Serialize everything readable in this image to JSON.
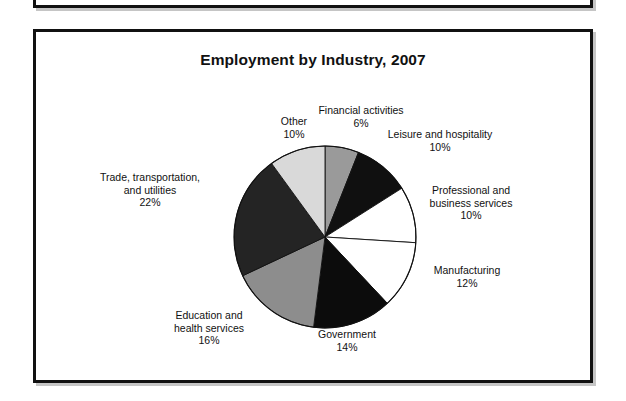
{
  "figure": {
    "title": "Employment by Industry, 2007"
  },
  "chart_data": {
    "type": "pie",
    "title": "Employment by Industry, 2007",
    "xlabel": "",
    "ylabel": "",
    "units": "percent",
    "legend_position": "none",
    "grid": false,
    "labels_show_percent": true,
    "start_angle_deg": 0,
    "direction": "clockwise",
    "categories": [
      "Financial activities",
      "Leisure and hospitality",
      "Professional and business services",
      "Manufacturing",
      "Government",
      "Education and health services",
      "Trade, transportation, and utilities",
      "Other"
    ],
    "values": [
      6,
      10,
      10,
      12,
      14,
      16,
      22,
      10
    ],
    "slices": [
      {
        "name": "Financial activities",
        "label_line1": "Financial activities",
        "label_line2": "6%",
        "value": 6,
        "color": "#9a9a9a"
      },
      {
        "name": "Leisure and hospitality",
        "label_line1": "Leisure and hospitality",
        "label_line2": "10%",
        "value": 10,
        "color": "#101010"
      },
      {
        "name": "Professional and business services",
        "label_line1": "Professional and",
        "label_line2": "business services",
        "label_line3": "10%",
        "value": 10,
        "color": "#ffffff"
      },
      {
        "name": "Manufacturing",
        "label_line1": "Manufacturing",
        "label_line2": "12%",
        "value": 12,
        "color": "#ffffff"
      },
      {
        "name": "Government",
        "label_line1": "Government",
        "label_line2": "14%",
        "value": 14,
        "color": "#0c0c0c"
      },
      {
        "name": "Education and health services",
        "label_line1": "Education and",
        "label_line2": "health services",
        "label_line3": "16%",
        "value": 16,
        "color": "#8d8d8d"
      },
      {
        "name": "Trade, transportation, and utilities",
        "label_line1": "Trade, transportation,",
        "label_line2": "and utilities",
        "label_line3": "22%",
        "value": 22,
        "color": "#242424"
      },
      {
        "name": "Other",
        "label_line1": "Other",
        "label_line2": "10%",
        "value": 10,
        "color": "#d9d9d9"
      }
    ]
  }
}
